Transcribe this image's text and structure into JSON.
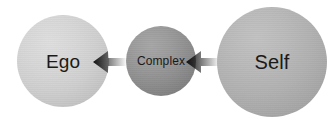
{
  "diagram": {
    "background_color": "#ffffff",
    "nodes": [
      {
        "id": "ego",
        "label": "Ego",
        "shape": "circle",
        "diameter_px": 92,
        "center": {
          "x": 63,
          "y": 61
        },
        "fill_color": "#cfcfcf",
        "text_color": "#1a1a1a"
      },
      {
        "id": "complex",
        "label": "Complex",
        "shape": "circle",
        "diameter_px": 70,
        "center": {
          "x": 161,
          "y": 61
        },
        "fill_color": "#909090",
        "text_color": "#1a1a1a"
      },
      {
        "id": "self",
        "label": "Self",
        "shape": "circle",
        "diameter_px": 110,
        "center": {
          "x": 272,
          "y": 62
        },
        "fill_color": "#b1b1b1",
        "text_color": "#1a1a1a"
      }
    ],
    "arrows": [
      {
        "id": "complex-to-ego",
        "icon": "arrow-left-icon",
        "direction": "left",
        "from": "Complex",
        "to": "Ego",
        "color": "#111111"
      },
      {
        "id": "self-to-complex",
        "icon": "arrow-left-icon",
        "direction": "left",
        "from": "Self",
        "to": "Complex",
        "color": "#111111"
      }
    ]
  }
}
